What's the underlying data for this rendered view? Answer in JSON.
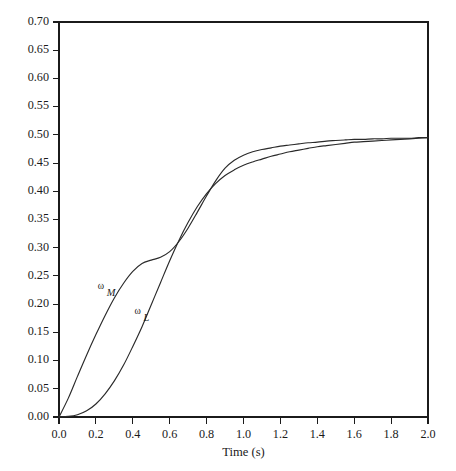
{
  "figure": {
    "background_color": "#ffffff",
    "line_color": "#2a2a2a",
    "axis_color": "#1b1b1b"
  },
  "axes": {
    "x_title": "Time (s)",
    "y_title": "",
    "x_ticks": [
      "0.0",
      "0.2",
      "0.4",
      "0.6",
      "0.8",
      "1.0",
      "1.2",
      "1.4",
      "1.6",
      "1.8",
      "2.0"
    ],
    "y_ticks": [
      "0.00",
      "0.05",
      "0.10",
      "0.15",
      "0.20",
      "0.25",
      "0.30",
      "0.35",
      "0.40",
      "0.45",
      "0.50",
      "0.55",
      "0.60",
      "0.65",
      "0.70"
    ]
  },
  "annotations": {
    "omega_symbol": "ω",
    "motor_subscript": "M",
    "load_subscript": "L"
  },
  "chart_data": {
    "type": "line",
    "title": "",
    "subtitle": "",
    "xlabel": "Time (s)",
    "ylabel": "",
    "xlim": [
      0.0,
      2.0
    ],
    "ylim": [
      0.0,
      0.7
    ],
    "xticks": [
      0.0,
      0.2,
      0.4,
      0.6,
      0.8,
      1.0,
      1.2,
      1.4,
      1.6,
      1.8,
      2.0
    ],
    "yticks": [
      0.0,
      0.05,
      0.1,
      0.15,
      0.2,
      0.25,
      0.3,
      0.35,
      0.4,
      0.45,
      0.5,
      0.55,
      0.6,
      0.65,
      0.7
    ],
    "grid": false,
    "legend": "inline-curve-labels",
    "frame": "full-box",
    "annotations": [
      {
        "text": "ω_M",
        "x": 0.215,
        "y": 0.228,
        "label_for": "omega_M"
      },
      {
        "text": "ω_L",
        "x": 0.415,
        "y": 0.185,
        "label_for": "omega_L"
      }
    ],
    "crossing_point": {
      "x": 0.54,
      "y": 0.278
    },
    "steady_state": 0.495,
    "x": [
      0.0,
      0.05,
      0.1,
      0.15,
      0.2,
      0.25,
      0.3,
      0.35,
      0.4,
      0.45,
      0.5,
      0.55,
      0.6,
      0.65,
      0.7,
      0.75,
      0.8,
      0.85,
      0.9,
      0.95,
      1.0,
      1.05,
      1.1,
      1.15,
      1.2,
      1.25,
      1.3,
      1.35,
      1.4,
      1.45,
      1.5,
      1.55,
      1.6,
      1.65,
      1.7,
      1.75,
      1.8,
      1.85,
      1.9,
      1.95,
      2.0
    ],
    "series": [
      {
        "name": "omega_M",
        "label": "ω_M",
        "description": "Motor angular velocity",
        "values": [
          0.0,
          0.033,
          0.072,
          0.11,
          0.146,
          0.18,
          0.211,
          0.237,
          0.258,
          0.272,
          0.278,
          0.283,
          0.293,
          0.311,
          0.335,
          0.363,
          0.392,
          0.419,
          0.441,
          0.455,
          0.464,
          0.47,
          0.474,
          0.477,
          0.48,
          0.482,
          0.484,
          0.486,
          0.487,
          0.489,
          0.49,
          0.491,
          0.492,
          0.492,
          0.493,
          0.493,
          0.494,
          0.494,
          0.494,
          0.495,
          0.495
        ]
      },
      {
        "name": "omega_L",
        "label": "ω_L",
        "description": "Load angular velocity",
        "values": [
          0.0,
          0.001,
          0.004,
          0.011,
          0.023,
          0.041,
          0.064,
          0.092,
          0.125,
          0.16,
          0.199,
          0.238,
          0.277,
          0.313,
          0.345,
          0.373,
          0.396,
          0.414,
          0.428,
          0.438,
          0.446,
          0.452,
          0.457,
          0.462,
          0.466,
          0.47,
          0.473,
          0.476,
          0.479,
          0.481,
          0.483,
          0.485,
          0.487,
          0.488,
          0.489,
          0.49,
          0.491,
          0.492,
          0.493,
          0.494,
          0.495
        ]
      }
    ]
  }
}
